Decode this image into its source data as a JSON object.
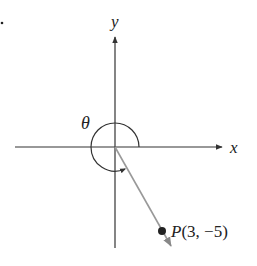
{
  "figure": {
    "type": "angle-in-standard-position",
    "axes": {
      "x_label": "x",
      "y_label": "y"
    },
    "angle": {
      "label": "θ",
      "direction": "counterclockwise",
      "terminal_quadrant": "IV"
    },
    "point": {
      "name": "P",
      "x": 3,
      "y": -5,
      "label_name": "P",
      "label_coords": "(3, −5)"
    },
    "colors": {
      "axes": "#333333",
      "ray": "#999999",
      "point": "#222222",
      "text": "#222222"
    },
    "stray_mark": "."
  }
}
